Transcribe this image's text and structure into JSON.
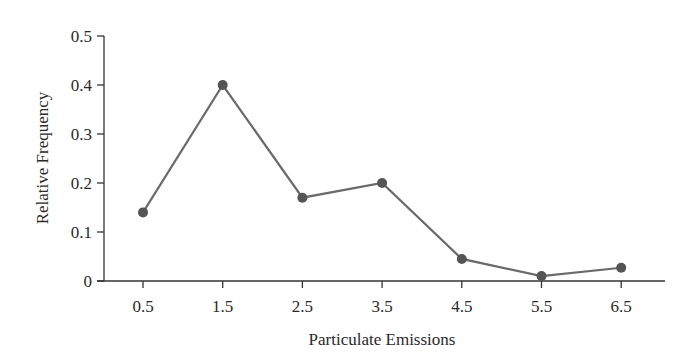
{
  "chart_data": {
    "type": "line",
    "title": "",
    "xlabel": "Particulate Emissions",
    "ylabel": "Relative Frequency",
    "categories": [
      "0.5",
      "1.5",
      "2.5",
      "3.5",
      "4.5",
      "5.5",
      "6.5"
    ],
    "x": [
      0.5,
      1.5,
      2.5,
      3.5,
      4.5,
      5.5,
      6.5
    ],
    "values": [
      0.14,
      0.4,
      0.17,
      0.2,
      0.045,
      0.01,
      0.027
    ],
    "yticks": [
      "0",
      "0.1",
      "0.2",
      "0.3",
      "0.4",
      "0.5"
    ],
    "ylim": [
      0,
      0.5
    ],
    "xlim": [
      0,
      7
    ],
    "grid": false,
    "legend": null,
    "markers": true
  },
  "style": {
    "line_color": "#6a6a6a",
    "marker_color": "#555555",
    "axis_color": "#333333"
  }
}
